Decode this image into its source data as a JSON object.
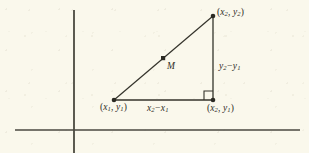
{
  "figure": {
    "kind": "coordinate-plane-diagram",
    "background_color": "#faf8ec",
    "ink_color": "#34332b"
  },
  "axes": {
    "x_axis": {
      "name": "x-axis",
      "y": 130,
      "x_start": 15,
      "x_end": 300
    },
    "y_axis": {
      "name": "y-axis",
      "x": 74,
      "y_start": 10,
      "y_end": 153
    }
  },
  "points": [
    {
      "id": "p1",
      "name": "lower-left-vertex",
      "x": 114,
      "y": 100,
      "label_x1": "x",
      "label_sub1": "1",
      "label_x2": "y",
      "label_sub2": "1"
    },
    {
      "id": "p2",
      "name": "upper-right-vertex",
      "x": 213,
      "y": 16,
      "label_x1": "x",
      "label_sub1": "2",
      "label_x2": "y",
      "label_sub2": "2"
    },
    {
      "id": "p3",
      "name": "lower-right-vertex",
      "x": 213,
      "y": 100,
      "label_x1": "x",
      "label_sub1": "2",
      "label_x2": "y",
      "label_sub2": "1"
    },
    {
      "id": "m",
      "name": "midpoint",
      "x": 163,
      "y": 58
    }
  ],
  "labels": {
    "point1": {
      "open": "(",
      "var1": "x",
      "sub1": "1",
      "comma": ", ",
      "var2": "y",
      "sub2": "1",
      "close": ")"
    },
    "point2": {
      "open": "(",
      "var1": "x",
      "sub1": "2",
      "comma": ", ",
      "var2": "y",
      "sub2": "2",
      "close": ")"
    },
    "point3": {
      "open": "(",
      "var1": "x",
      "sub1": "2",
      "comma": ", ",
      "var2": "y",
      "sub2": "1",
      "close": ")"
    },
    "horizontal_leg": {
      "var1": "x",
      "sub1": "2",
      "op": "−",
      "var2": "x",
      "sub2": "1"
    },
    "vertical_leg": {
      "var1": "y",
      "sub1": "2",
      "op": "−",
      "var2": "y",
      "sub2": "1"
    },
    "midpoint": {
      "text": "M"
    }
  },
  "segments": [
    {
      "name": "hypotenuse",
      "from": "p1",
      "to": "p2"
    },
    {
      "name": "horizontal-leg",
      "from": "p1",
      "to": "p3"
    },
    {
      "name": "vertical-leg",
      "from": "p3",
      "to": "p2"
    }
  ],
  "right_angle_marker": {
    "name": "right-angle-marker",
    "x": 204,
    "y": 91,
    "size": 9
  }
}
